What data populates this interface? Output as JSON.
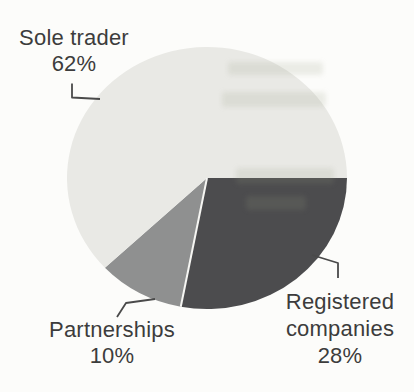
{
  "chart_data": {
    "type": "pie",
    "title": "",
    "direction": "clockwise",
    "start_angle_deg": 0,
    "start_reference": "east",
    "slices": [
      {
        "id": "registered-companies",
        "label": "Registered companies",
        "value": 28,
        "percent_label": "28%",
        "color": "#4c4c4e"
      },
      {
        "id": "partnerships",
        "label": "Partnerships",
        "value": 10,
        "percent_label": "10%",
        "color": "#8f9090"
      },
      {
        "id": "sole-trader",
        "label": "Sole trader",
        "value": 62,
        "percent_label": "62%",
        "color": "#e9e9e5"
      }
    ],
    "divider_color": "#f6f6f3",
    "leader_line_color": "#4a4a4a",
    "background_color": "#fcfcfa",
    "legend_position": "callouts-around-pie"
  },
  "callouts": {
    "sole_trader": {
      "line1": "Sole trader",
      "line2": "62%"
    },
    "partnerships": {
      "line1": "Partnerships",
      "line2": "10%"
    },
    "registered_companies": {
      "line1": "Registered",
      "line2": "companies",
      "line3": "28%"
    }
  }
}
